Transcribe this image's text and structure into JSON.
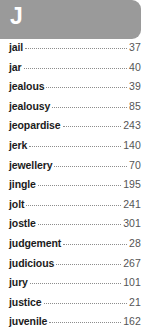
{
  "header": {
    "letter": "J",
    "background_color": "#9a9a9a",
    "text_color": "#ffffff"
  },
  "index": {
    "entries": [
      {
        "term": "jail",
        "page": "37"
      },
      {
        "term": "jar",
        "page": "40"
      },
      {
        "term": "jealous",
        "page": "39"
      },
      {
        "term": "jealousy",
        "page": "85"
      },
      {
        "term": "jeopardise",
        "page": "243"
      },
      {
        "term": "jerk",
        "page": "140"
      },
      {
        "term": "jewellery",
        "page": "70"
      },
      {
        "term": "jingle",
        "page": "195"
      },
      {
        "term": "jolt",
        "page": "241"
      },
      {
        "term": "jostle",
        "page": "301"
      },
      {
        "term": "judgement",
        "page": "28"
      },
      {
        "term": "judicious",
        "page": "267"
      },
      {
        "term": "jury",
        "page": "101"
      },
      {
        "term": "justice",
        "page": "21"
      },
      {
        "term": "juvenile",
        "page": "162"
      }
    ]
  },
  "colors": {
    "page_background": "#ffffff",
    "term_text": "#1b1b1b",
    "page_number_text": "#555555",
    "leader_dots": "#8d8d8d"
  }
}
